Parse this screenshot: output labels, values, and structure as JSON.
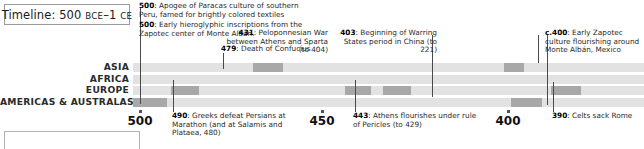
{
  "title": {
    "prefix": "Timeline: 500 ",
    "era_start": "BCE",
    "range_sep": "–1 ",
    "era_end": "CE"
  },
  "regions": [
    {
      "label": "ASIA"
    },
    {
      "label": "AFRICA"
    },
    {
      "label": "EUROPE"
    },
    {
      "label": "AMERICAS & AUSTRALASIA"
    }
  ],
  "axis": {
    "ticks": [
      {
        "label": "500",
        "x": 140
      },
      {
        "label": "450",
        "x": 322
      },
      {
        "label": "400",
        "x": 508
      }
    ]
  },
  "annotations": [
    {
      "id": "anno-500-paracas",
      "year": "500",
      "text": ": Apogee of Paracas culture of southern Peru, famed for brightly colored textiles",
      "align": "left",
      "x": 139,
      "y": 2,
      "width": 170
    },
    {
      "id": "anno-500-zapotec",
      "year": "500",
      "text": ": Early hieroglyphic inscriptions from the Zapotec center of Monte Albán.",
      "align": "left",
      "x": 139,
      "y": 21,
      "width": 170
    },
    {
      "id": "anno-479-confucius",
      "year": "479",
      "text": ": Death of Confucius",
      "align": "left",
      "x": 221,
      "y": 45,
      "width": 110
    },
    {
      "id": "anno-431-peloponnesian",
      "year": "431",
      "text": ": Peloponnesian War between Athens and Sparta (to 404)",
      "align": "right",
      "x": 328,
      "y": 29,
      "width": 102
    },
    {
      "id": "anno-403-warring-states",
      "year": "403",
      "text": ": Beginning of Warring States period in China (to 221)",
      "align": "right",
      "x": 437,
      "y": 29,
      "width": 100
    },
    {
      "id": "anno-400-zapotec",
      "year": "c.400",
      "text": ": Early Zapotec culture flourishing around Monte Albán, Mexico",
      "align": "left",
      "x": 545,
      "y": 29,
      "width": 100
    },
    {
      "id": "anno-490-marathon",
      "year": "490",
      "text": ": Greeks defeat Persians at Marathon (and at Salamis and Plataea, 480)",
      "align": "left",
      "x": 172,
      "y": 112,
      "width": 125
    },
    {
      "id": "anno-443-pericles",
      "year": "443",
      "text": ": Athens flourishes under rule of Pericles (to 429)",
      "align": "left",
      "x": 353,
      "y": 112,
      "width": 125
    },
    {
      "id": "anno-390-celts",
      "year": "390",
      "text": ": Celts sack Rome",
      "align": "left",
      "x": 552,
      "y": 112,
      "width": 95
    }
  ],
  "chart_data": {
    "type": "heatmap",
    "title": "Timeline: 500 BCE–1 CE",
    "xlabel": "",
    "ylabel": "",
    "categories": [
      "ASIA",
      "AFRICA",
      "EUROPE",
      "AMERICAS & AUSTRALASIA"
    ],
    "x_ticks": [
      500,
      450,
      400
    ],
    "grid": true,
    "legend": "none",
    "cell_count": 17,
    "track_color": "#e2e2e2",
    "highlight_color": "#a8a8a8",
    "highlights": [
      {
        "region": "ASIA",
        "row": 0,
        "x": 120,
        "width": 30,
        "event": "479: Death of Confucius"
      },
      {
        "region": "ASIA",
        "row": 0,
        "x": 371,
        "width": 20,
        "event": "403: Beginning of Warring States period in China (to 221)"
      },
      {
        "region": "EUROPE",
        "row": 2,
        "x": 38,
        "width": 28,
        "event": "490: Greeks defeat Persians at Marathon"
      },
      {
        "region": "EUROPE",
        "row": 2,
        "x": 212,
        "width": 26,
        "event": "443: Athens flourishes under rule of Pericles (to 429)"
      },
      {
        "region": "EUROPE",
        "row": 2,
        "x": 250,
        "width": 28,
        "event": "431: Peloponnesian War between Athens and Sparta (to 404)"
      },
      {
        "region": "EUROPE",
        "row": 2,
        "x": 418,
        "width": 30,
        "event": "390: Celts sack Rome"
      },
      {
        "region": "AMERICAS & AUSTRALASIA",
        "row": 3,
        "x": 0,
        "width": 34,
        "event": "500: Apogee of Paracas culture / Zapotec inscriptions"
      },
      {
        "region": "AMERICAS & AUSTRALASIA",
        "row": 3,
        "x": 378,
        "width": 31,
        "event": "c.400: Early Zapotec culture flourishing around Monte Albán, Mexico"
      }
    ]
  },
  "leaders": [
    {
      "id": "leader-500",
      "x": 140,
      "top": 8,
      "height": 96
    },
    {
      "id": "leader-479",
      "x": 223,
      "top": 53,
      "height": 16
    },
    {
      "id": "leader-431",
      "x": 432,
      "top": 35,
      "height": 62
    },
    {
      "id": "leader-403",
      "x": 538,
      "top": 35,
      "height": 28
    },
    {
      "id": "leader-400",
      "x": 547,
      "top": 35,
      "height": 70
    },
    {
      "id": "leader-490",
      "x": 173,
      "top": 80,
      "height": 32
    },
    {
      "id": "leader-443",
      "x": 355,
      "top": 80,
      "height": 32
    },
    {
      "id": "leader-390",
      "x": 553,
      "top": 82,
      "height": 30
    }
  ]
}
